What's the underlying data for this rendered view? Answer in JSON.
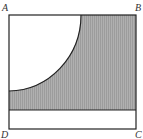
{
  "diagram": {
    "labels": {
      "A": "A",
      "B": "B",
      "C": "C",
      "D": "D"
    },
    "colors": {
      "stroke": "#222222",
      "shade": "#a8a8a8",
      "background": "#ffffff"
    }
  }
}
